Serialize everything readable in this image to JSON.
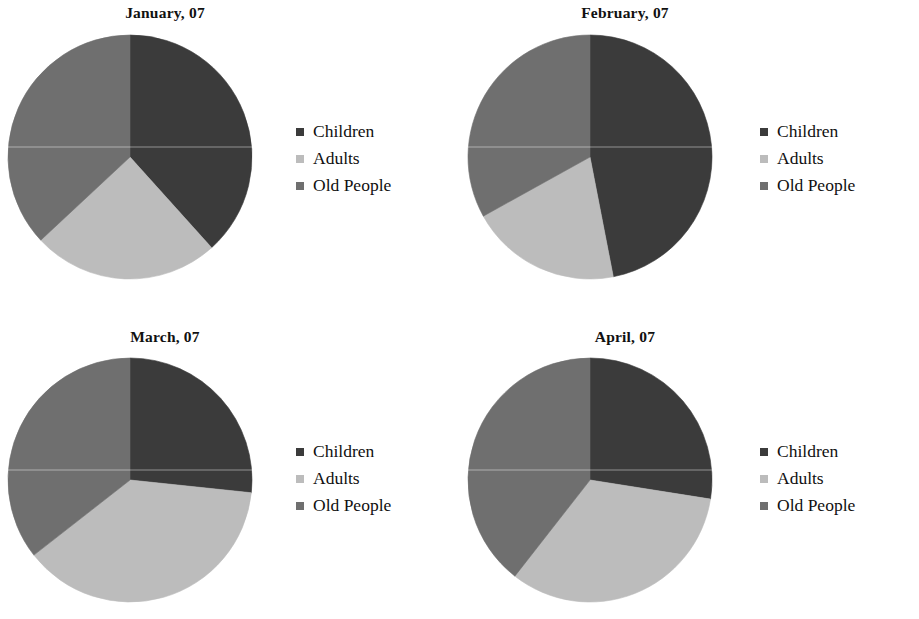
{
  "page": {
    "background": "#ffffff",
    "legend_labels": [
      "Children",
      "Adults",
      "Old People"
    ],
    "colors": {
      "children": "#3b3b3b",
      "adults": "#bcbcbc",
      "old_people": "#6f6f6f"
    }
  },
  "charts": [
    {
      "title": "January, 07",
      "legend": [
        {
          "label": "Children",
          "color": "#3b3b3b"
        },
        {
          "label": "Adults",
          "color": "#bcbcbc"
        },
        {
          "label": "Old People",
          "color": "#6f6f6f"
        }
      ]
    },
    {
      "title": "February, 07",
      "legend": [
        {
          "label": "Children",
          "color": "#3b3b3b"
        },
        {
          "label": "Adults",
          "color": "#bcbcbc"
        },
        {
          "label": "Old People",
          "color": "#6f6f6f"
        }
      ]
    },
    {
      "title": "March, 07",
      "legend": [
        {
          "label": "Children",
          "color": "#3b3b3b"
        },
        {
          "label": "Adults",
          "color": "#bcbcbc"
        },
        {
          "label": "Old People",
          "color": "#6f6f6f"
        }
      ]
    },
    {
      "title": "April, 07",
      "legend": [
        {
          "label": "Children",
          "color": "#3b3b3b"
        },
        {
          "label": "Adults",
          "color": "#bcbcbc"
        },
        {
          "label": "Old People",
          "color": "#6f6f6f"
        }
      ]
    }
  ],
  "chart_data": [
    {
      "type": "pie",
      "title": "January, 07",
      "categories": [
        "Children",
        "Adults",
        "Old People"
      ],
      "values": [
        38,
        25,
        37
      ],
      "angles_deg": [
        138,
        89,
        133
      ],
      "colors": [
        "#3b3b3b",
        "#bcbcbc",
        "#6f6f6f"
      ],
      "start_angle_deg": 0,
      "direction": "clockwise",
      "legend_position": "right",
      "grid": false,
      "xlabel": "",
      "ylabel": ""
    },
    {
      "type": "pie",
      "title": "February, 07",
      "categories": [
        "Children",
        "Adults",
        "Old People"
      ],
      "values": [
        47,
        20,
        33
      ],
      "angles_deg": [
        169,
        72,
        119
      ],
      "colors": [
        "#3b3b3b",
        "#bcbcbc",
        "#6f6f6f"
      ],
      "start_angle_deg": 0,
      "direction": "clockwise",
      "legend_position": "right",
      "grid": false,
      "xlabel": "",
      "ylabel": ""
    },
    {
      "type": "pie",
      "title": "March, 07",
      "categories": [
        "Children",
        "Adults",
        "Old People"
      ],
      "values": [
        27,
        38,
        35
      ],
      "angles_deg": [
        96,
        136,
        128
      ],
      "colors": [
        "#3b3b3b",
        "#bcbcbc",
        "#6f6f6f"
      ],
      "start_angle_deg": 0,
      "direction": "clockwise",
      "legend_position": "right",
      "grid": false,
      "xlabel": "",
      "ylabel": ""
    },
    {
      "type": "pie",
      "title": "April, 07",
      "categories": [
        "Children",
        "Adults",
        "Old People"
      ],
      "values": [
        28,
        33,
        39
      ],
      "angles_deg": [
        99,
        119,
        142
      ],
      "colors": [
        "#3b3b3b",
        "#bcbcbc",
        "#6f6f6f"
      ],
      "start_angle_deg": 0,
      "direction": "clockwise",
      "legend_position": "right",
      "grid": false,
      "xlabel": "",
      "ylabel": ""
    }
  ]
}
